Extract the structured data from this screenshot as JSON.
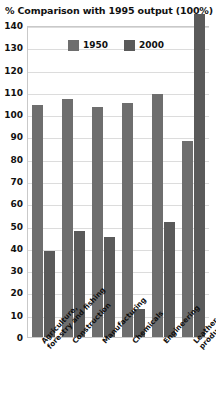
{
  "chart_data": {
    "type": "bar",
    "title": "% Comparison with 1995 output (100%)",
    "xlabel": "",
    "ylabel": "",
    "ylim": [
      0,
      140
    ],
    "ytick_step": 10,
    "yticks": [
      140,
      130,
      120,
      110,
      100,
      90,
      80,
      70,
      60,
      50,
      40,
      30,
      20,
      10,
      0
    ],
    "grid": true,
    "legend_position": "top-center",
    "categories": [
      "Agriculture, forestry and fishing",
      "Construction",
      "Manufacturing",
      "Chemicals",
      "Engineering",
      "Leather and leather products"
    ],
    "category_lines": [
      [
        "Agriculture,",
        "forestry and fishing"
      ],
      [
        "Construction",
        ""
      ],
      [
        "Manufacturing",
        ""
      ],
      [
        "Chemicals",
        ""
      ],
      [
        "Engineering",
        ""
      ],
      [
        "Leather and leather",
        "products"
      ]
    ],
    "series": [
      {
        "name": "1950",
        "color": "#6e6e6e",
        "values": [
          104,
          107,
          103,
          105,
          109,
          88
        ]
      },
      {
        "name": "2000",
        "color": "#5a5a5a",
        "values": [
          38.5,
          47.5,
          45,
          12.5,
          51.5,
          145
        ]
      }
    ]
  },
  "colors": {
    "series_1950": "#6e6e6e",
    "series_2000": "#5a5a5a",
    "gridline": "#dcdcdc",
    "axis": "#c9c9c9",
    "text": "#111111",
    "background": "#ffffff"
  }
}
